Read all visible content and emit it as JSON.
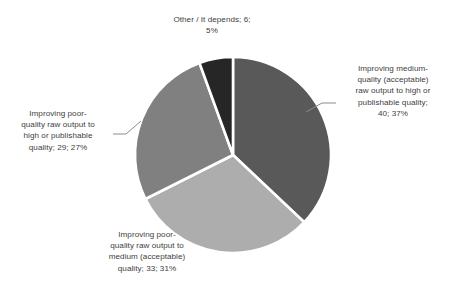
{
  "chart_data": {
    "type": "pie",
    "title": "",
    "subtitle": "",
    "xlabel": "",
    "ylabel": "",
    "grid": false,
    "legend_position": "none",
    "label_format": "category; value; percent",
    "total": 108,
    "start_angle_deg": 0,
    "direction": "clockwise",
    "categories": [
      "Improving medium-quality (acceptable) raw output to high or publishable quality",
      "Improving poor-quality raw output to medium (acceptable) quality",
      "Improving poor-quality raw output to high or publishable quality",
      "Other / It depends"
    ],
    "values": [
      40,
      33,
      29,
      6
    ],
    "percents": [
      37,
      31,
      27,
      5
    ],
    "colors": [
      "#595959",
      "#ADADAD",
      "#808080",
      "#262626"
    ],
    "slice_border_color": "#FFFFFF",
    "slices": [
      {
        "name": "improving-medium-to-high",
        "category": "Improving medium-quality (acceptable) raw output to high or publishable quality",
        "value": 40,
        "percent": 37,
        "percent_label": "37%",
        "color": "#595959",
        "label_text": "Improving medium-quality (acceptable) raw output to high or publishable quality; 40; 37%"
      },
      {
        "name": "improving-poor-to-medium",
        "category": "Improving poor-quality raw output to medium (acceptable) quality",
        "value": 33,
        "percent": 31,
        "percent_label": "31%",
        "color": "#ADADAD",
        "label_text": "Improving poor-quality raw output to medium (acceptable) quality; 33; 31%"
      },
      {
        "name": "improving-poor-to-high",
        "category": "Improving poor-quality raw output to high or publishable quality",
        "value": 29,
        "percent": 27,
        "percent_label": "27%",
        "color": "#808080",
        "label_text": "Improving poor-quality raw output to high or publishable quality; 29; 27%"
      },
      {
        "name": "other-it-depends",
        "category": "Other / It depends",
        "value": 6,
        "percent": 5,
        "percent_label": "5%",
        "color": "#262626",
        "label_text": "Other / It depends; 6; 5%"
      }
    ]
  },
  "labels": {
    "right": "Improving medium-\nquality (acceptable)\nraw output to high or\npublishable quality;\n40; 37%",
    "left": "Improving poor-\nquality raw output to\nhigh or publishable\nquality; 29; 27%",
    "bottom": "Improving poor-\nquality raw output to\nmedium (acceptable)\nquality; 33; 31%",
    "top": "Other / It depends; 6;\n5%"
  },
  "style": {
    "background": "#FFFFFF",
    "text_color": "#404040",
    "leader_line_color": "#8C8C8C"
  }
}
